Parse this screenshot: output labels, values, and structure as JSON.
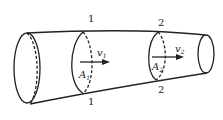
{
  "diagram": {
    "title": "",
    "type": "pipe-flow-continuity",
    "sections": [
      {
        "id": "1",
        "top_label": "1",
        "bottom_label": "1",
        "area_label": "A",
        "area_sub": "1",
        "velocity_label": "v",
        "velocity_sub": "1"
      },
      {
        "id": "2",
        "top_label": "2",
        "bottom_label": "2",
        "area_label": "A",
        "area_sub": "2",
        "velocity_label": "v",
        "velocity_sub": "2"
      }
    ],
    "colors": {
      "stroke": "#222222",
      "background": "#ffffff"
    }
  }
}
